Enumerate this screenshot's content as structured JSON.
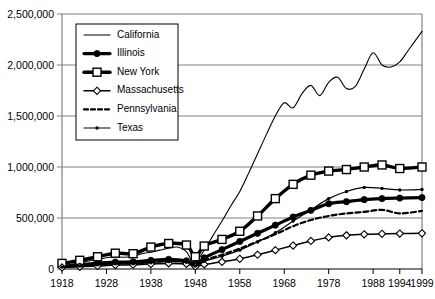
{
  "chart_data": {
    "type": "line",
    "title": "",
    "xlabel": "",
    "ylabel": "",
    "xlim": [
      1918,
      1999
    ],
    "ylim": [
      0,
      2500000
    ],
    "grid": true,
    "legend_position": "top-left",
    "x_ticks": [
      "1918",
      "1928",
      "1938",
      "1948",
      "1958",
      "1968",
      "1978",
      "1988",
      "1994",
      "1999"
    ],
    "x_tick_values": [
      1918,
      1928,
      1938,
      1948,
      1958,
      1968,
      1978,
      1988,
      1994,
      1999
    ],
    "y_ticks": [
      "0",
      "500,000",
      "1,000,000",
      "1,500,000",
      "2,000,000",
      "2,500,000"
    ],
    "y_tick_values": [
      0,
      500000,
      1000000,
      1500000,
      2000000,
      2500000
    ],
    "series": [
      {
        "name": "California",
        "marker": "none",
        "dash": "none",
        "color": "#000000",
        "x": [
          1918,
          1920,
          1922,
          1924,
          1926,
          1928,
          1930,
          1932,
          1934,
          1936,
          1938,
          1940,
          1942,
          1944,
          1946,
          1947,
          1948,
          1950,
          1952,
          1954,
          1956,
          1958,
          1960,
          1962,
          1964,
          1966,
          1968,
          1970,
          1972,
          1974,
          1976,
          1978,
          1980,
          1982,
          1984,
          1986,
          1988,
          1990,
          1992,
          1994,
          1996,
          1999
        ],
        "y": [
          30000,
          45000,
          60000,
          78000,
          95000,
          110000,
          120000,
          115000,
          125000,
          150000,
          165000,
          185000,
          205000,
          215000,
          170000,
          90000,
          60000,
          185000,
          330000,
          470000,
          620000,
          760000,
          940000,
          1130000,
          1320000,
          1500000,
          1630000,
          1580000,
          1720000,
          1800000,
          1700000,
          1830000,
          1880000,
          1770000,
          1790000,
          1960000,
          2120000,
          2000000,
          1980000,
          2030000,
          2150000,
          2330000
        ]
      },
      {
        "name": "Illinois",
        "marker": "filled-circle",
        "dash": "none",
        "color": "#000000",
        "x": [
          1918,
          1922,
          1926,
          1930,
          1934,
          1938,
          1942,
          1946,
          1948,
          1950,
          1954,
          1958,
          1962,
          1966,
          1970,
          1974,
          1978,
          1982,
          1986,
          1990,
          1994,
          1999
        ],
        "y": [
          25000,
          40000,
          58000,
          68000,
          70000,
          85000,
          95000,
          80000,
          45000,
          110000,
          190000,
          270000,
          350000,
          430000,
          510000,
          575000,
          640000,
          660000,
          680000,
          690000,
          695000,
          700000
        ]
      },
      {
        "name": "New York",
        "marker": "open-square",
        "dash": "none",
        "color": "#000000",
        "x": [
          1918,
          1922,
          1926,
          1930,
          1934,
          1938,
          1942,
          1946,
          1948,
          1950,
          1954,
          1958,
          1962,
          1966,
          1970,
          1974,
          1978,
          1982,
          1986,
          1990,
          1994,
          1999
        ],
        "y": [
          55000,
          85000,
          120000,
          155000,
          150000,
          215000,
          250000,
          235000,
          120000,
          225000,
          290000,
          370000,
          520000,
          690000,
          830000,
          920000,
          960000,
          975000,
          1000000,
          1020000,
          985000,
          1000000
        ]
      },
      {
        "name": "Massachusetts",
        "marker": "open-diamond",
        "dash": "none",
        "color": "#000000",
        "x": [
          1918,
          1922,
          1926,
          1930,
          1934,
          1938,
          1942,
          1946,
          1948,
          1950,
          1954,
          1958,
          1962,
          1966,
          1970,
          1974,
          1978,
          1982,
          1986,
          1990,
          1994,
          1999
        ],
        "y": [
          15000,
          22000,
          30000,
          38000,
          42000,
          48000,
          55000,
          50000,
          25000,
          45000,
          70000,
          100000,
          140000,
          185000,
          230000,
          275000,
          310000,
          330000,
          340000,
          345000,
          348000,
          350000
        ]
      },
      {
        "name": "Pennsylvania",
        "marker": "none",
        "dash": "dashed",
        "color": "#000000",
        "x": [
          1918,
          1922,
          1926,
          1930,
          1934,
          1938,
          1942,
          1946,
          1948,
          1950,
          1954,
          1958,
          1962,
          1966,
          1970,
          1974,
          1978,
          1982,
          1986,
          1990,
          1994,
          1999
        ],
        "y": [
          20000,
          32000,
          45000,
          55000,
          58000,
          70000,
          78000,
          70000,
          35000,
          85000,
          140000,
          200000,
          270000,
          340000,
          420000,
          480000,
          520000,
          545000,
          560000,
          580000,
          545000,
          570000
        ]
      },
      {
        "name": "Texas",
        "marker": "small-dot",
        "dash": "none",
        "color": "#000000",
        "x": [
          1918,
          1922,
          1926,
          1930,
          1934,
          1938,
          1942,
          1946,
          1948,
          1950,
          1954,
          1958,
          1962,
          1966,
          1970,
          1974,
          1978,
          1982,
          1986,
          1990,
          1994,
          1999
        ],
        "y": [
          18000,
          28000,
          40000,
          50000,
          52000,
          62000,
          72000,
          65000,
          30000,
          75000,
          125000,
          185000,
          265000,
          355000,
          470000,
          580000,
          690000,
          760000,
          800000,
          790000,
          775000,
          780000
        ]
      }
    ]
  },
  "legend": {
    "items": [
      {
        "label": "California"
      },
      {
        "label": "Illinois"
      },
      {
        "label": "New York"
      },
      {
        "label": "Massachusetts"
      },
      {
        "label": "Pennsylvania"
      },
      {
        "label": "Texas"
      }
    ]
  }
}
